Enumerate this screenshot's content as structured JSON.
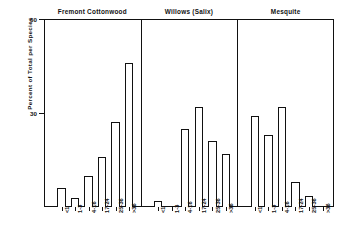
{
  "chart_data": {
    "type": "bar",
    "title": "",
    "xlabel": "",
    "ylabel": "Percent of Total per Species",
    "ylim": [
      0,
      60
    ],
    "yticks": [
      30,
      60
    ],
    "ytick_labels": [
      "30",
      "60"
    ],
    "grid": false,
    "legend": "none",
    "categories": [
      "<1",
      "1-3",
      "4-16",
      "17-24",
      "25-36",
      ">36"
    ],
    "panels": [
      {
        "name": "Fremont Cottonwood",
        "values": [
          6,
          3,
          10,
          16,
          27,
          46
        ]
      },
      {
        "name": "Willows (Salix)",
        "values": [
          2,
          0,
          25,
          32,
          21,
          17
        ]
      },
      {
        "name": "Mesquite",
        "values": [
          29,
          23,
          32,
          8,
          3.5,
          0
        ]
      }
    ],
    "series": [
      {
        "name": "Fremont Cottonwood",
        "values": [
          6,
          3,
          10,
          16,
          27,
          46
        ]
      },
      {
        "name": "Willows (Salix)",
        "values": [
          2,
          0,
          25,
          32,
          21,
          17
        ]
      },
      {
        "name": "Mesquite",
        "values": [
          29,
          23,
          32,
          8,
          3.5,
          0
        ]
      }
    ],
    "colors": {
      "bar_fill": "#ffffff",
      "bar_stroke": "#111111",
      "axis": "#111111",
      "background": "#ffffff"
    }
  }
}
